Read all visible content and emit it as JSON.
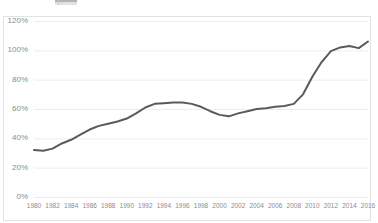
{
  "chart_data": {
    "type": "line",
    "title": "",
    "subtitle": "",
    "xlabel": "",
    "ylabel": "",
    "grid": "horizontal",
    "legend": "none",
    "ylim": [
      0,
      120
    ],
    "ytick_labels": [
      "0%",
      "20%",
      "40%",
      "60%",
      "80%",
      "100%",
      "120%"
    ],
    "ytick_values": [
      0,
      20,
      40,
      60,
      80,
      100,
      120
    ],
    "xlim": [
      1980,
      2016
    ],
    "xtick_labels": [
      "1980",
      "1982",
      "1984",
      "1986",
      "1988",
      "1990",
      "1992",
      "1994",
      "1996",
      "1998",
      "2000",
      "2002",
      "2004",
      "2006",
      "2008",
      "2010",
      "2012",
      "2014",
      "2016"
    ],
    "xtick_values": [
      1980,
      1982,
      1984,
      1986,
      1988,
      1990,
      1992,
      1994,
      1996,
      1998,
      2000,
      2002,
      2004,
      2006,
      2008,
      2010,
      2012,
      2014,
      2016
    ],
    "x": [
      1980,
      1981,
      1982,
      1983,
      1984,
      1985,
      1986,
      1987,
      1988,
      1989,
      1990,
      1991,
      1992,
      1993,
      1994,
      1995,
      1996,
      1997,
      1998,
      1999,
      2000,
      2001,
      2002,
      2003,
      2004,
      2005,
      2006,
      2007,
      2008,
      2009,
      2010,
      2011,
      2012,
      2013,
      2014,
      2015,
      2016
    ],
    "values": [
      32,
      31.5,
      33,
      36.5,
      39,
      42.5,
      46,
      48.5,
      50,
      51.5,
      53.5,
      57,
      61,
      63.5,
      64,
      64.5,
      64.5,
      63.5,
      61.5,
      58.5,
      56,
      55,
      57,
      58.5,
      60,
      60.5,
      61.5,
      62,
      63.5,
      70,
      82,
      92,
      99.5,
      102,
      103,
      101.5,
      106
    ],
    "series_name": "",
    "line_color": "#5a5a5a",
    "line_width": 2,
    "markers": "none",
    "grid_color": "#ededed",
    "axis_text_color": "#8c8c8c",
    "background_color": "#ffffff",
    "border_color": "#e2e2e2"
  },
  "layout": {
    "plot_left": 34,
    "plot_right": 368,
    "plot_top": 21,
    "plot_bottom": 197
  }
}
